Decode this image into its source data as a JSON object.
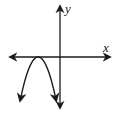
{
  "chart_data": {
    "type": "line",
    "title": "",
    "xlabel": "x",
    "ylabel": "y",
    "grid": false,
    "ticks": false,
    "xlim": [
      -5,
      5
    ],
    "ylim": [
      -5,
      5
    ],
    "series": [
      {
        "name": "parabola",
        "description": "downward-opening parabola, vertex on negative x-axis, both ends continuing downward",
        "function": "y = -a(x - h)^2",
        "vertex": [
          -2.3,
          0
        ],
        "x": [
          -4.2,
          -3.5,
          -3.0,
          -2.3,
          -1.6,
          -1.1,
          -0.4
        ],
        "y": [
          -4.3,
          -1.7,
          -0.5,
          0,
          -0.5,
          -1.7,
          -4.3
        ]
      }
    ]
  },
  "colors": {
    "stroke": "#1a1a1a"
  }
}
